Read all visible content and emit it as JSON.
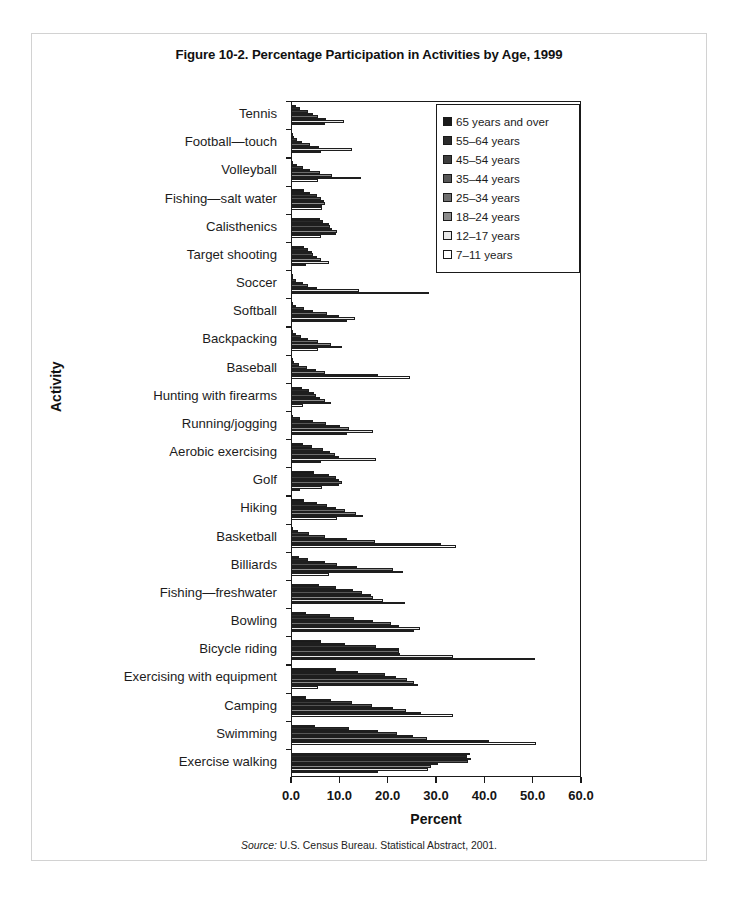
{
  "figure": {
    "title": "Figure 10-2. Percentage Participation in Activities by Age, 1999",
    "source_label": "Source:",
    "source_text": " U.S. Census Bureau. Statistical Abstract, 2001."
  },
  "chart_data": {
    "type": "bar",
    "orientation": "horizontal",
    "title": "Figure 10-2. Percentage Participation in Activities by Age, 1999",
    "xlabel": "Percent",
    "ylabel": "Activity",
    "xlim": [
      0.0,
      60.0
    ],
    "xticks": [
      "0.0",
      "10.0",
      "20.0",
      "30.0",
      "40.0",
      "50.0",
      "60.0"
    ],
    "grid": false,
    "legend_position": "top-right-inside",
    "categories": [
      "Tennis",
      "Football—touch",
      "Volleyball",
      "Fishing—salt water",
      "Calisthenics",
      "Target shooting",
      "Soccer",
      "Softball",
      "Backpacking",
      "Baseball",
      "Hunting with firearms",
      "Running/jogging",
      "Aerobic exercising",
      "Golf",
      "Hiking",
      "Basketball",
      "Billiards",
      "Fishing—freshwater",
      "Bowling",
      "Bicycle riding",
      "Exercising with equipment",
      "Camping",
      "Swimming",
      "Exercise walking"
    ],
    "series": [
      {
        "name": "65 years and over",
        "color": "#1a1a1a",
        "values": [
          1.1,
          0.3,
          0.5,
          2.6,
          6.1,
          2.6,
          0.2,
          0.4,
          0.4,
          0.3,
          2.3,
          0.5,
          2.5,
          4.8,
          2.7,
          0.4,
          1.6,
          5.7,
          3.0,
          6.3,
          9.4,
          3.2,
          5.0,
          37.0
        ]
      },
      {
        "name": "55–64 years",
        "color": "#2b2b2b",
        "values": [
          1.8,
          0.6,
          1.2,
          4.0,
          6.7,
          3.6,
          0.5,
          1.1,
          1.1,
          0.7,
          3.7,
          1.8,
          4.3,
          7.9,
          5.3,
          1.5,
          3.6,
          9.4,
          8.1,
          11.1,
          13.8,
          8.3,
          12.0,
          36.5
        ]
      },
      {
        "name": "45–54 years",
        "color": "#3d3d3d",
        "values": [
          3.5,
          1.2,
          2.5,
          5.3,
          7.9,
          4.3,
          1.1,
          2.6,
          2.1,
          1.7,
          4.8,
          4.6,
          6.7,
          9.4,
          7.5,
          3.7,
          7.0,
          12.9,
          13.1,
          17.5,
          19.5,
          12.7,
          18.0,
          37.3
        ]
      },
      {
        "name": "35–44 years",
        "color": "#565656",
        "values": [
          4.6,
          2.3,
          4.0,
          6.3,
          8.1,
          4.6,
          2.5,
          4.6,
          3.6,
          3.4,
          5.1,
          7.2,
          8.0,
          9.9,
          9.4,
          7.1,
          9.6,
          14.6,
          16.9,
          22.3,
          21.8,
          16.8,
          22.0,
          36.6
        ]
      },
      {
        "name": "25–34 years",
        "color": "#6e6e6e",
        "values": [
          5.6,
          3.9,
          6.0,
          6.9,
          8.5,
          5.4,
          3.6,
          7.4,
          5.6,
          5.1,
          6.1,
          10.1,
          9.1,
          10.5,
          11.2,
          11.5,
          13.7,
          16.5,
          20.7,
          22.4,
          24.0,
          21.0,
          25.3,
          30.5
        ]
      },
      {
        "name": "18–24 years",
        "color": "#8c8c8c",
        "values": [
          7.2,
          5.7,
          8.4,
          7.0,
          9.6,
          6.2,
          5.3,
          10.0,
          8.2,
          7.0,
          7.1,
          12.0,
          10.0,
          10.0,
          13.4,
          17.4,
          21.0,
          17.0,
          22.4,
          22.6,
          25.5,
          23.7,
          28.1,
          29.0
        ]
      },
      {
        "name": "12–17 years",
        "color": "#e8e8e8",
        "values": [
          11.0,
          12.6,
          14.5,
          6.5,
          9.3,
          7.8,
          14.1,
          13.3,
          10.5,
          18.0,
          8.3,
          16.9,
          17.5,
          6.4,
          14.9,
          31.0,
          23.2,
          19.0,
          26.6,
          33.5,
          26.3,
          26.9,
          41.0,
          28.3
        ]
      },
      {
        "name": "7–11 years",
        "color": "#ffffff",
        "values": [
          7.0,
          6.3,
          5.5,
          6.4,
          6.2,
          3.2,
          28.5,
          11.5,
          5.6,
          24.7,
          2.5,
          11.5,
          6.2,
          1.8,
          9.5,
          34.2,
          7.8,
          23.5,
          25.5,
          50.5,
          5.5,
          33.6,
          50.7,
          18.1
        ]
      }
    ]
  },
  "legend": {
    "items": [
      {
        "label": "65 years and over",
        "color": "#1a1a1a"
      },
      {
        "label": "55–64 years",
        "color": "#2b2b2b"
      },
      {
        "label": "45–54 years",
        "color": "#3d3d3d"
      },
      {
        "label": "35–44 years",
        "color": "#565656"
      },
      {
        "label": "25–34 years",
        "color": "#6e6e6e"
      },
      {
        "label": "18–24 years",
        "color": "#8c8c8c"
      },
      {
        "label": "12–17 years",
        "color": "#e8e8e8"
      },
      {
        "label": " 7–11 years",
        "color": "#ffffff"
      }
    ]
  }
}
